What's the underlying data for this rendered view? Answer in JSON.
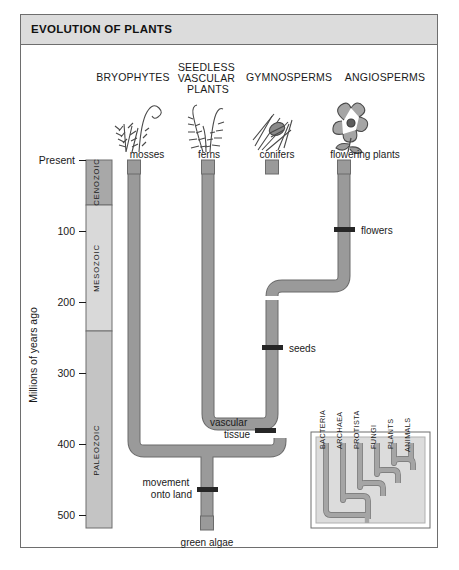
{
  "figure": {
    "title": "EVOLUTION OF PLANTS"
  },
  "axis": {
    "label": "Millions of years ago",
    "ticks": [
      {
        "text": "Present",
        "value": 0
      },
      {
        "text": "100",
        "value": 100
      },
      {
        "text": "200",
        "value": 200
      },
      {
        "text": "300",
        "value": 300
      },
      {
        "text": "400",
        "value": 400
      },
      {
        "text": "500",
        "value": 500
      }
    ]
  },
  "eras": [
    {
      "name": "CENOZOIC",
      "start": 0,
      "end": 65,
      "color": "#a8a8a8"
    },
    {
      "name": "MESOZOIC",
      "start": 65,
      "end": 251,
      "color": "#d9d9d9"
    },
    {
      "name": "PALEOZOIC",
      "start": 251,
      "end": 542,
      "color": "#c4c4c4"
    }
  ],
  "groups": [
    {
      "name": "BRYOPHYTES",
      "common": "mosses",
      "icon": "moss-illustration"
    },
    {
      "name": "SEEDLESS VASCULAR PLANTS",
      "common": "ferns",
      "icon": "fern-illustration"
    },
    {
      "name": "GYMNOSPERMS",
      "common": "conifers",
      "icon": "conifer-illustration"
    },
    {
      "name": "ANGIOSPERMS",
      "common": "flowering plants",
      "icon": "flower-illustration"
    }
  ],
  "root": {
    "common": "green algae"
  },
  "events": [
    {
      "label": "flowers",
      "value": 130
    },
    {
      "label": "seeds",
      "value": 360
    },
    {
      "label": "vascular tissue",
      "value": 425
    },
    {
      "label": "movement onto land",
      "value": 475
    }
  ],
  "inset": {
    "taxa": [
      "BACTERIA",
      "ARCHAEA",
      "PROTISTA",
      "FUNGI",
      "PLANTS",
      "ANIMALS"
    ]
  },
  "colors": {
    "branch_fill": "#9a9a9a",
    "branch_stroke": "#4d4d4d",
    "event_marker": "#2b2b2b",
    "frame": "#6e6e6e",
    "title_bar": "#dcdcdc",
    "inset_bg": "#dcdcdc"
  }
}
